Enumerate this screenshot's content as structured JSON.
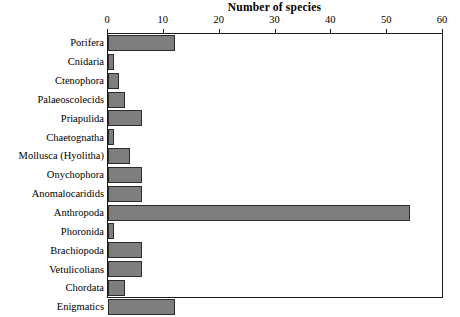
{
  "chart_data": {
    "type": "bar",
    "orientation": "horizontal",
    "title": "Number of species",
    "xlabel": "Number of species",
    "ylabel": "",
    "xlim": [
      0,
      60
    ],
    "ylim": null,
    "grid": false,
    "legend": null,
    "xticks": [
      0,
      10,
      20,
      30,
      40,
      50,
      60
    ],
    "xtick_labels": [
      "0",
      "10",
      "20",
      "30",
      "40",
      "50",
      "60"
    ],
    "bar_color": "#7e7e7e",
    "bar_edge_color": "#2b2b2b",
    "axis_color": "#1a1a1a",
    "categories": [
      "Porifera",
      "Cnidaria",
      "Ctenophora",
      "Palaeoscolecids",
      "Priapulida",
      "Chaetognatha",
      "Mollusca (Hyolitha)",
      "Onychophora",
      "Anomalocaridids",
      "Anthropoda",
      "Phoronida",
      "Brachiopoda",
      "Vetulicolians",
      "Chordata",
      "Enigmatics"
    ],
    "values": [
      12,
      1,
      2,
      3,
      6,
      1,
      4,
      6,
      6,
      54,
      1,
      6,
      6,
      3,
      12
    ]
  }
}
